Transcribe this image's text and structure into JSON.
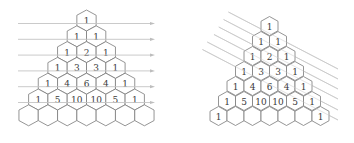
{
  "figures": [
    {
      "id": "left",
      "description": "Pascal's triangle in hexagonal cells with horizontal arrows through each row",
      "arrow_direction": "horizontal",
      "rows": [
        [
          "1"
        ],
        [
          "1",
          "1"
        ],
        [
          "1",
          "2",
          "1"
        ],
        [
          "1",
          "3",
          "3",
          "1"
        ],
        [
          "1",
          "4",
          "6",
          "4",
          "1"
        ],
        [
          "1",
          "5",
          "10",
          "10",
          "5",
          "1"
        ],
        [
          "",
          "",
          "",
          "",
          "",
          "",
          ""
        ]
      ]
    },
    {
      "id": "right",
      "description": "Pascal's triangle in hexagonal cells with diagonal lines through the shallow diagonals",
      "arrow_direction": "diagonal",
      "rows": [
        [
          "1"
        ],
        [
          "1",
          "1"
        ],
        [
          "1",
          "2",
          "1"
        ],
        [
          "1",
          "3",
          "3",
          "1"
        ],
        [
          "1",
          "4",
          "6",
          "4",
          "1"
        ],
        [
          "1",
          "5",
          "10",
          "10",
          "5",
          "1"
        ],
        [
          "1",
          "",
          "",
          "",
          "",
          "",
          "1"
        ]
      ]
    }
  ],
  "colors": {
    "hex_stroke": "#7a7a7a",
    "text": "#3a3a3a",
    "guide_lines": "#c4c4c4",
    "background": "#ffffff"
  }
}
